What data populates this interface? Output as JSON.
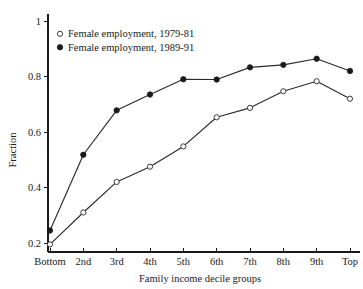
{
  "chart_data": {
    "type": "line",
    "title": "",
    "xlabel": "Family income decile groups",
    "ylabel": "Fraction",
    "categories": [
      "Bottom",
      "2nd",
      "3rd",
      "4th",
      "5th",
      "6th",
      "7th",
      "8th",
      "9th",
      "Top"
    ],
    "ylim": [
      0.17,
      1.0
    ],
    "yticks": [
      0.2,
      0.4,
      0.6,
      0.8,
      1.0
    ],
    "ytick_labels": [
      "0.2",
      "0.4",
      "0.6",
      "0.8",
      "1"
    ],
    "grid": false,
    "legend_position": "upper-left-inside",
    "series": [
      {
        "name": "Female employment, 1979-81",
        "marker": "open-circle",
        "values": [
          0.195,
          0.31,
          0.42,
          0.475,
          0.548,
          0.653,
          0.687,
          0.747,
          0.783,
          0.72
        ]
      },
      {
        "name": "Female employment, 1989-91",
        "marker": "filled-circle",
        "values": [
          0.245,
          0.518,
          0.678,
          0.735,
          0.79,
          0.789,
          0.833,
          0.842,
          0.864,
          0.82
        ]
      }
    ]
  },
  "legend": {
    "entries": [
      {
        "label": "Female employment, 1979-81",
        "marker": "open-circle"
      },
      {
        "label": "Female employment, 1989-91",
        "marker": "filled-circle"
      }
    ]
  },
  "axes": {
    "y_title": "Fraction",
    "x_title": "Family income decile groups"
  }
}
